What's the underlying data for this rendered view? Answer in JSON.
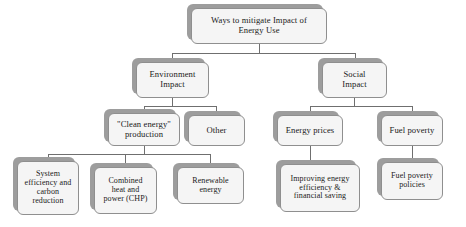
{
  "diagram": {
    "title": "Ways to mitigate Impact of Energy Use",
    "type": "hierarchy-tree",
    "orientation": "top-down",
    "style": {
      "box_fill": "#f5f5f5",
      "box_border": "#8f8f8f",
      "shadow_fill": "#9d9d9d",
      "connector_color": "#6f6f6f",
      "background": "#ffffff",
      "text_color": "#1a1a1a"
    },
    "nodes": [
      {
        "id": "root",
        "label": "Ways to mitigate Impact of\nEnergy Use",
        "level": 0,
        "x": 191,
        "y": 8,
        "w": 136,
        "h": 36,
        "font": "fs-9"
      },
      {
        "id": "environment-impact",
        "label": "Environment\nImpact",
        "level": 1,
        "x": 136,
        "y": 62,
        "w": 73,
        "h": 36,
        "font": "fs-9"
      },
      {
        "id": "social-impact",
        "label": "Social\nImpact",
        "level": 1,
        "x": 322,
        "y": 62,
        "w": 65,
        "h": 36,
        "font": "fs-9"
      },
      {
        "id": "clean-energy-production",
        "label": "\"Clean energy\"\nproduction",
        "level": 2,
        "x": 108,
        "y": 113,
        "w": 72,
        "h": 33,
        "font": "fs-9"
      },
      {
        "id": "other",
        "label": "Other",
        "level": 2,
        "x": 188,
        "y": 115,
        "w": 57,
        "h": 31,
        "font": "fs-9"
      },
      {
        "id": "energy-prices",
        "label": "Energy prices",
        "level": 2,
        "x": 277,
        "y": 115,
        "w": 66,
        "h": 31,
        "font": "fs-9"
      },
      {
        "id": "fuel-poverty",
        "label": "Fuel poverty",
        "level": 2,
        "x": 381,
        "y": 115,
        "w": 62,
        "h": 31,
        "font": "fs-9"
      },
      {
        "id": "system-efficiency-carbon-reduction",
        "label": "System\nefficiency and\ncarbon\nreduction",
        "level": 3,
        "x": 17,
        "y": 161,
        "w": 62,
        "h": 54,
        "font": "fs-8"
      },
      {
        "id": "combined-heat-power-chp",
        "label": "Combined\nheat and\npower (CHP)",
        "level": 3,
        "x": 94,
        "y": 167,
        "w": 63,
        "h": 47,
        "font": "fs-8"
      },
      {
        "id": "renewable-energy",
        "label": "Renewable\nenergy",
        "level": 3,
        "x": 177,
        "y": 167,
        "w": 67,
        "h": 37,
        "font": "fs-8"
      },
      {
        "id": "improving-energy-efficiency-financial-saving",
        "label": "Improving energy\nefficiency &\nfinancial saving",
        "level": 3,
        "x": 280,
        "y": 164,
        "w": 80,
        "h": 48,
        "font": "fs-8"
      },
      {
        "id": "fuel-poverty-policies",
        "label": "Fuel poverty\npolicies",
        "level": 3,
        "x": 381,
        "y": 162,
        "w": 62,
        "h": 38,
        "font": "fs-8"
      }
    ],
    "edges": [
      {
        "from": "root",
        "to": "environment-impact"
      },
      {
        "from": "root",
        "to": "social-impact"
      },
      {
        "from": "environment-impact",
        "to": "clean-energy-production"
      },
      {
        "from": "environment-impact",
        "to": "other"
      },
      {
        "from": "clean-energy-production",
        "to": "system-efficiency-carbon-reduction"
      },
      {
        "from": "clean-energy-production",
        "to": "combined-heat-power-chp"
      },
      {
        "from": "clean-energy-production",
        "to": "renewable-energy"
      },
      {
        "from": "social-impact",
        "to": "energy-prices"
      },
      {
        "from": "social-impact",
        "to": "fuel-poverty"
      },
      {
        "from": "energy-prices",
        "to": "improving-energy-efficiency-financial-saving"
      },
      {
        "from": "fuel-poverty",
        "to": "fuel-poverty-policies"
      }
    ]
  }
}
